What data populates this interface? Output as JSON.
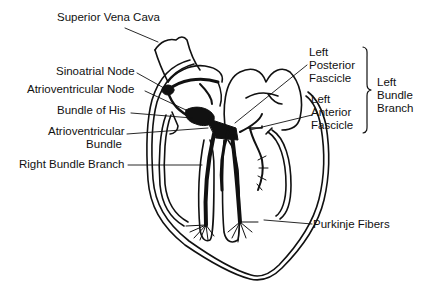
{
  "diagram": {
    "colors": {
      "ink": "#111111",
      "background": "#ffffff"
    },
    "labels": {
      "superior_vena_cava": "Superior Vena Cava",
      "sinoatrial_node": "Sinoatrial Node",
      "atrioventricular_node": "Atrioventricular Node",
      "bundle_of_his": "Bundle of His",
      "av_bundle_line1": "Atrioventricular",
      "av_bundle_line2": "Bundle",
      "right_bundle_branch": "Right Bundle Branch",
      "left_posterior_line1": "Left",
      "left_posterior_line2": "Posterior",
      "left_posterior_line3": "Fascicle",
      "left_anterior_line1": "Left",
      "left_anterior_line2": "Anterior",
      "left_anterior_line3": "Fascicle",
      "left_bundle_line1": "Left",
      "left_bundle_line2": "Bundle",
      "left_bundle_line3": "Branch",
      "purkinje_fibers": "Purkinje Fibers"
    },
    "groupings": [
      {
        "bracket": "right-curly-brace",
        "members": [
          "Left Posterior Fascicle",
          "Left Anterior Fascicle"
        ],
        "group_label": "Left Bundle Branch"
      }
    ]
  }
}
